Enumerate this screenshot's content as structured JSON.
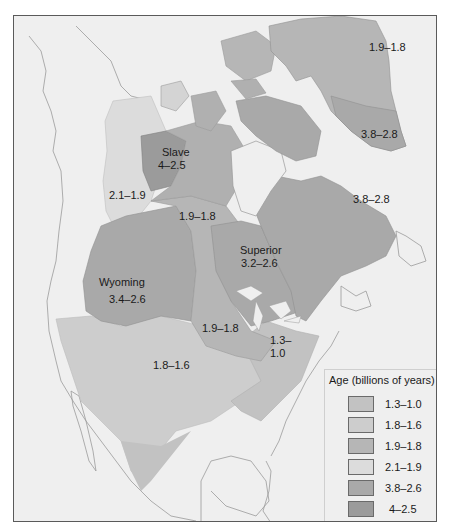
{
  "map": {
    "title": "North American craton ages",
    "colors": {
      "background": "#efefef",
      "coast": "#9a9a9a",
      "c_1_3_1_0": "#c2c2c2",
      "c_1_8_1_6": "#cdcdcd",
      "c_1_9_1_8": "#b6b6b6",
      "c_2_1_1_9": "#dcdcdc",
      "c_3_8_2_6": "#a9a9a9",
      "c_4_2_5": "#9b9b9b"
    },
    "regions": [
      {
        "id": "greenland-north",
        "label": "1.9–1.8"
      },
      {
        "id": "greenland-south",
        "label": "3.8–2.8"
      },
      {
        "id": "slave",
        "name": "Slave",
        "label": "4–2.5"
      },
      {
        "id": "wopmay",
        "label": "2.1–1.9"
      },
      {
        "id": "trans-hudson",
        "label": "1.9–1.8"
      },
      {
        "id": "labrador",
        "label": "3.8–2.8"
      },
      {
        "id": "superior",
        "name": "Superior",
        "label": "3.2–2.6"
      },
      {
        "id": "wyoming",
        "name": "Wyoming",
        "label": "3.4–2.6"
      },
      {
        "id": "penokean",
        "label": "1.9–1.8"
      },
      {
        "id": "grenville",
        "label_line1": "1.3–",
        "label_line2": "1.0"
      },
      {
        "id": "yavapai",
        "label": "1.8–1.6"
      }
    ]
  },
  "legend": {
    "title": "Age (billions of years)",
    "items": [
      {
        "label": "1.3–1.0",
        "color": "#c2c2c2"
      },
      {
        "label": "1.8–1.6",
        "color": "#cdcdcd"
      },
      {
        "label": "1.9–1.8",
        "color": "#b6b6b6"
      },
      {
        "label": "2.1–1.9",
        "color": "#dcdcdc"
      },
      {
        "label": "3.8–2.6",
        "color": "#a9a9a9"
      },
      {
        "label": "4–2.5",
        "color": "#9b9b9b"
      }
    ]
  }
}
